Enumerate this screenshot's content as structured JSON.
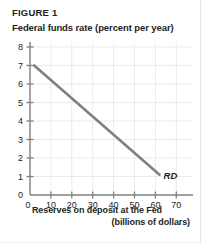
{
  "figure": {
    "label": "FIGURE 1",
    "y_axis_title": "Federal funds rate (percent per year)",
    "x_axis_title_line1": "Reserves on deposit at the Fed",
    "x_axis_title_line2": "(billions of dollars)"
  },
  "colors": {
    "line": "#808080",
    "axis": "#808080",
    "grid": "#ebebeb",
    "text": "#231f20",
    "background": "#ffffff"
  },
  "chart_data": {
    "type": "line",
    "title": "FIGURE 1",
    "xlabel": "Reserves on deposit at the Fed (billions of dollars)",
    "ylabel": "Federal funds rate (percent per year)",
    "xlim": [
      0,
      78
    ],
    "ylim": [
      0,
      8
    ],
    "xticks": [
      0,
      10,
      20,
      30,
      40,
      50,
      60,
      70
    ],
    "xticklabels": [
      "0",
      "10",
      "20",
      "30",
      "40",
      "50",
      "60",
      "70"
    ],
    "yticks": [
      0,
      1,
      2,
      3,
      4,
      5,
      6,
      7,
      8
    ],
    "yticklabels": [
      "0",
      "1",
      "2",
      "3",
      "4",
      "5",
      "6",
      "7",
      "8"
    ],
    "grid": true,
    "legend": "none",
    "series": [
      {
        "name": "RD",
        "label": "RD",
        "annotation": "RD",
        "x": [
          2,
          62
        ],
        "y": [
          7.0,
          1.1
        ]
      }
    ]
  }
}
